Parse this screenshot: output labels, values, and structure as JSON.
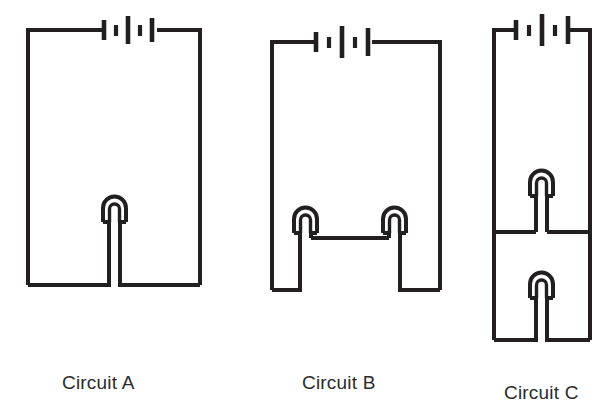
{
  "figure": {
    "kind": "circuit-diagram-set",
    "ink_color": "#231f20",
    "background_color": "#ffffff",
    "caption_color": "#2b2b2b"
  },
  "circuits": [
    {
      "id": "a",
      "label": "Circuit A",
      "battery": {
        "name": "battery-symbol",
        "cells": 2,
        "plates": [
          "long",
          "short",
          "long",
          "short",
          "long"
        ]
      },
      "lamps": 1,
      "topology": "single lamp in a simple series loop"
    },
    {
      "id": "b",
      "label": "Circuit B",
      "battery": {
        "name": "battery-symbol",
        "cells": 2,
        "plates": [
          "long",
          "short",
          "long",
          "short",
          "long"
        ]
      },
      "lamps": 2,
      "topology": "two lamps connected in series along the bottom wire"
    },
    {
      "id": "c",
      "label": "Circuit C",
      "battery": {
        "name": "battery-symbol",
        "cells": 2,
        "plates": [
          "long",
          "short",
          "long",
          "short",
          "long"
        ]
      },
      "lamps": 2,
      "topology": "two lamps connected in parallel on separate branches"
    }
  ]
}
